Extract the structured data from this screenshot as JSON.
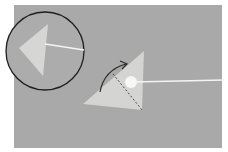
{
  "image": {
    "description": "Craft instruction photo: felt triangle with white string, dashed fold line, curved fold arrow, and circular inset showing the folded result",
    "colors": {
      "background": "#a9a9a9",
      "felt": "#d6d6d4",
      "string": "#f4f4f4",
      "circle_outline": "#1e1e1e",
      "fold_line": "#4a4a4a",
      "arrow": "#2a2a2a"
    }
  }
}
